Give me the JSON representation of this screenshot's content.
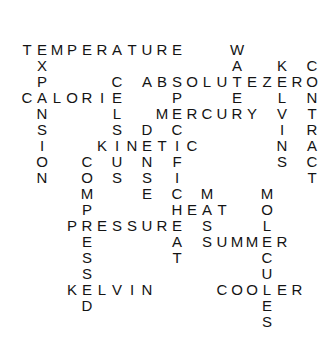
{
  "puzzle": {
    "type": "word-crossword-solution",
    "grid": {
      "origin_x": 27,
      "origin_y": 50,
      "cell_w": 15,
      "cell_h": 16
    },
    "words": [
      {
        "word": "TEMPERATURE",
        "col": 0,
        "row": 0,
        "dir": "across"
      },
      {
        "word": "EXPANSION",
        "col": 1,
        "row": 0,
        "dir": "down"
      },
      {
        "word": "CALORIE",
        "col": 0,
        "row": 3,
        "dir": "across"
      },
      {
        "word": "CELSIUS",
        "col": 6,
        "row": 2,
        "dir": "down"
      },
      {
        "word": "ABSOLUTEZERO",
        "col": 8,
        "row": 2,
        "dir": "across"
      },
      {
        "word": "WATER",
        "col": 14,
        "row": 0,
        "dir": "down"
      },
      {
        "word": "KELVINS",
        "col": 17,
        "row": 1,
        "dir": "down"
      },
      {
        "word": "CONTRACT",
        "col": 19,
        "row": 1,
        "dir": "down"
      },
      {
        "word": "MERCURY",
        "col": 9,
        "row": 4,
        "dir": "across"
      },
      {
        "word": "SPECIFICHEAT",
        "col": 10,
        "row": 2,
        "dir": "down"
      },
      {
        "word": "KINETIC",
        "col": 5,
        "row": 6,
        "dir": "across"
      },
      {
        "word": "DENSE",
        "col": 8,
        "row": 5,
        "dir": "down"
      },
      {
        "word": "COMPRESSED",
        "col": 4,
        "row": 7,
        "dir": "down"
      },
      {
        "word": "PRESSURE",
        "col": 3,
        "row": 11,
        "dir": "across"
      },
      {
        "word": "KELVIN",
        "col": 3,
        "row": 15,
        "dir": "across"
      },
      {
        "word": "HEAT",
        "col": 10,
        "row": 10,
        "dir": "across"
      },
      {
        "word": "MASS",
        "col": 12,
        "row": 9,
        "dir": "down"
      },
      {
        "word": "SUMMER",
        "col": 12,
        "row": 12,
        "dir": "across"
      },
      {
        "word": "MOLECULES",
        "col": 16,
        "row": 9,
        "dir": "down"
      },
      {
        "word": "COOLER",
        "col": 13,
        "row": 15,
        "dir": "across"
      }
    ]
  }
}
